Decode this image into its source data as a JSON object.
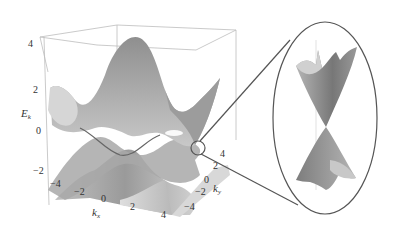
{
  "figure": {
    "z_axis": {
      "label": "E",
      "subscript": "k",
      "ticks": [
        "4",
        "2",
        "0",
        "−2"
      ]
    },
    "x_axis": {
      "label": "k",
      "subscript": "x",
      "ticks": [
        "−4",
        "−2",
        "0",
        "2",
        "4"
      ]
    },
    "y_axis": {
      "label": "k",
      "subscript": "y",
      "ticks": [
        "4",
        "2",
        "0",
        "−2",
        "−4"
      ]
    },
    "inset": {
      "content": "Dirac cone (upper and lower bands touching at a point)"
    },
    "colors": {
      "surface_dark": "#8a8a8a",
      "surface_light": "#d4d4d4",
      "frame": "#b0b0b0",
      "zoom_line": "#555555"
    }
  }
}
